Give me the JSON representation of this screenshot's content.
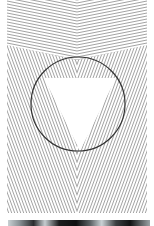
{
  "image": {
    "description": "Optical illusion: striped line pattern with a circle containing an illusory white inverted triangle",
    "colors": {
      "background": "#ffffff",
      "lines": "#8c8c8c",
      "circle": "#333333"
    },
    "circle": {
      "cx": 78,
      "cy": 104,
      "r": 47
    },
    "triangle": {
      "points": "44,78 116,78 80,151"
    },
    "pattern": {
      "left": 7,
      "right": 147,
      "top": 0,
      "bottom": 213,
      "center_x": 77,
      "line_spacing": 3
    },
    "photo_strip": {
      "top": 220,
      "height": 6
    }
  }
}
